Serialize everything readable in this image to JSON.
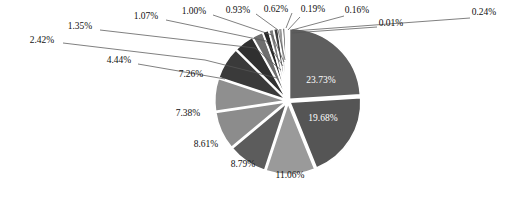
{
  "chart_data": {
    "type": "pie",
    "title": "",
    "subtitle": "",
    "xlabel": "",
    "ylabel": "",
    "legend_position": "none",
    "grid": false,
    "start_angle_deg": 0,
    "direction": "clockwise",
    "value_unit": "percent",
    "label_format": "0.00%",
    "categories": [
      "Slice 1",
      "Slice 2",
      "Slice 3",
      "Slice 4",
      "Slice 5",
      "Slice 6",
      "Slice 7",
      "Slice 8",
      "Slice 9",
      "Slice 10",
      "Slice 11",
      "Slice 12",
      "Slice 13",
      "Slice 14",
      "Slice 15",
      "Slice 16",
      "Slice 17",
      "Slice 18"
    ],
    "values": [
      23.73,
      19.68,
      11.06,
      8.79,
      8.61,
      7.38,
      7.26,
      4.44,
      2.42,
      1.35,
      1.07,
      1.0,
      0.93,
      0.62,
      0.19,
      0.16,
      0.24,
      0.01
    ],
    "data_labels": [
      "23.73%",
      "19.68%",
      "11.06%",
      "8.79%",
      "8.61%",
      "7.38%",
      "7.26%",
      "4.44%",
      "2.42%",
      "1.35%",
      "1.07%",
      "1.00%",
      "0.93%",
      "0.62%",
      "0.19%",
      "0.16%",
      "0.24%",
      "0.01%"
    ],
    "colors": [
      "#5e5e5e",
      "#555555",
      "#9a9a9a",
      "#5c5c5c",
      "#8c8c8c",
      "#8f8f8f",
      "#3a3a3a",
      "#303030",
      "#6e6e6e",
      "#2a2a2a",
      "#7d7d7d",
      "#3f3f3f",
      "#999999",
      "#4a4a4a",
      "#777777",
      "#2e2e2e",
      "#8a8a8a",
      "#1e1e1e"
    ],
    "total": 99.94
  },
  "geometry": {
    "center_x": 288,
    "center_y": 101,
    "radius": 71
  },
  "labels": [
    {
      "text": "23.73%",
      "x": 321,
      "y": 83,
      "anchor": "middle",
      "placement": "inside"
    },
    {
      "text": "19.68%",
      "x": 323,
      "y": 121,
      "anchor": "middle",
      "placement": "inside"
    },
    {
      "text": "11.06%",
      "x": 290,
      "y": 178,
      "anchor": "middle",
      "placement": "outside"
    },
    {
      "text": "8.79%",
      "x": 243,
      "y": 167,
      "anchor": "middle",
      "placement": "outside"
    },
    {
      "text": "8.61%",
      "x": 206,
      "y": 147,
      "anchor": "middle",
      "placement": "outside"
    },
    {
      "text": "7.38%",
      "x": 188,
      "y": 116,
      "anchor": "middle",
      "placement": "outside"
    },
    {
      "text": "7.26%",
      "x": 191,
      "y": 77,
      "anchor": "middle",
      "placement": "outside"
    },
    {
      "text": "4.44%",
      "x": 119,
      "y": 63,
      "anchor": "middle",
      "placement": "outside"
    },
    {
      "text": "2.42%",
      "x": 42,
      "y": 43,
      "anchor": "middle",
      "placement": "outside"
    },
    {
      "text": "1.35%",
      "x": 80,
      "y": 29,
      "anchor": "middle",
      "placement": "outside"
    },
    {
      "text": "1.07%",
      "x": 146,
      "y": 19,
      "anchor": "middle",
      "placement": "outside"
    },
    {
      "text": "1.00%",
      "x": 194,
      "y": 14,
      "anchor": "middle",
      "placement": "outside"
    },
    {
      "text": "0.93%",
      "x": 238,
      "y": 13,
      "anchor": "middle",
      "placement": "outside"
    },
    {
      "text": "0.62%",
      "x": 276,
      "y": 12,
      "anchor": "middle",
      "placement": "outside"
    },
    {
      "text": "0.19%",
      "x": 313,
      "y": 12,
      "anchor": "middle",
      "placement": "outside"
    },
    {
      "text": "0.16%",
      "x": 357,
      "y": 13,
      "anchor": "middle",
      "placement": "outside"
    },
    {
      "text": "0.24%",
      "x": 484,
      "y": 15,
      "anchor": "middle",
      "placement": "outside"
    },
    {
      "text": "0.01%",
      "x": 391,
      "y": 26,
      "anchor": "middle",
      "placement": "outside"
    }
  ],
  "leaders": [
    {
      "points": "63,43 205,60 277,78"
    },
    {
      "points": "100,30 255,48 281,70"
    },
    {
      "points": "166,20 266,41 283,66"
    },
    {
      "points": "213,15 272,35 284,62"
    },
    {
      "points": "256,14 278,30 285,60"
    },
    {
      "points": "292,13 286,28"
    },
    {
      "points": "300,17 288,30"
    },
    {
      "points": "344,16 292,30"
    },
    {
      "points": "470,18 293,31"
    },
    {
      "points": "377,27 292,33"
    },
    {
      "points": "138,64 225,79"
    }
  ]
}
